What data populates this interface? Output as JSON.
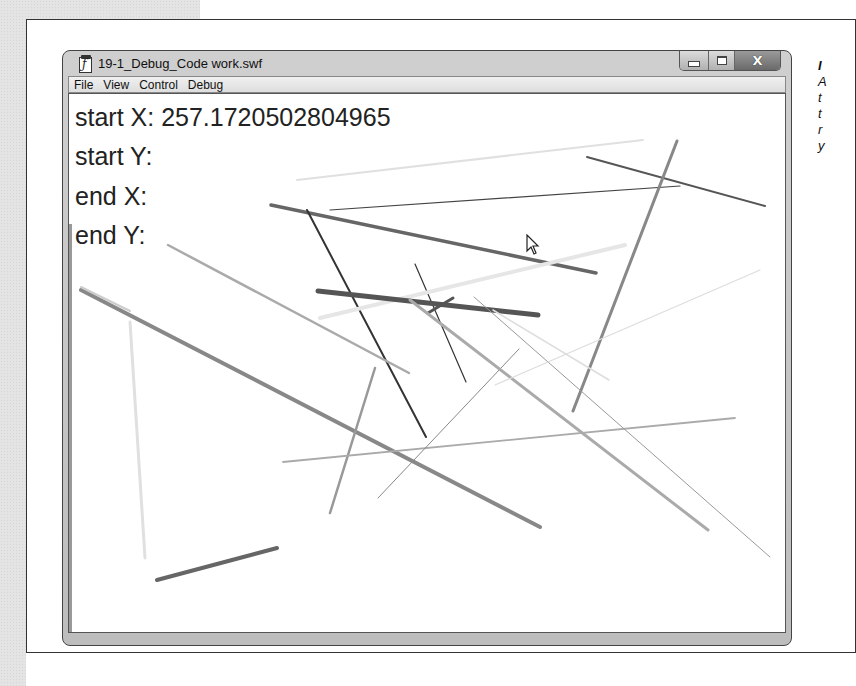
{
  "window": {
    "title": "19-1_Debug_Code work.swf",
    "icon": "flash-document-icon",
    "caption_buttons": {
      "minimize": "minimize-icon",
      "maximize": "maximize-icon",
      "close": "X"
    }
  },
  "menubar": {
    "items": [
      {
        "label": "File"
      },
      {
        "label": "View"
      },
      {
        "label": "Control"
      },
      {
        "label": "Debug"
      }
    ]
  },
  "readouts": {
    "start_x": "start X: 257.1720502804965",
    "start_y": "start Y:",
    "end_x": "end X:",
    "end_y": "end Y:"
  },
  "side_caption": {
    "lines": [
      "I",
      "A",
      "t",
      "t",
      "r",
      "y"
    ]
  },
  "canvas_lines": [
    {
      "x1": 297,
      "y1": 180,
      "x2": 643,
      "y2": 140,
      "w": 2,
      "c": "#e0e0e0"
    },
    {
      "x1": 587,
      "y1": 157,
      "x2": 765,
      "y2": 206,
      "w": 2,
      "c": "#555555"
    },
    {
      "x1": 330,
      "y1": 210,
      "x2": 680,
      "y2": 186,
      "w": 1.2,
      "c": "#444444"
    },
    {
      "x1": 271,
      "y1": 205,
      "x2": 596,
      "y2": 273,
      "w": 3.5,
      "c": "#666666"
    },
    {
      "x1": 307,
      "y1": 210,
      "x2": 426,
      "y2": 437,
      "w": 2,
      "c": "#333333"
    },
    {
      "x1": 415,
      "y1": 264,
      "x2": 466,
      "y2": 382,
      "w": 1.2,
      "c": "#333333"
    },
    {
      "x1": 320,
      "y1": 318,
      "x2": 625,
      "y2": 245,
      "w": 4,
      "c": "#e6e6e6"
    },
    {
      "x1": 318,
      "y1": 291,
      "x2": 538,
      "y2": 315,
      "w": 5,
      "c": "#555555"
    },
    {
      "x1": 428,
      "y1": 313,
      "x2": 453,
      "y2": 298,
      "w": 3,
      "c": "#555555"
    },
    {
      "x1": 677,
      "y1": 141,
      "x2": 573,
      "y2": 411,
      "w": 3,
      "c": "#888888"
    },
    {
      "x1": 168,
      "y1": 245,
      "x2": 409,
      "y2": 373,
      "w": 2.5,
      "c": "#aaaaaa"
    },
    {
      "x1": 81,
      "y1": 290,
      "x2": 540,
      "y2": 527,
      "w": 4,
      "c": "#888888"
    },
    {
      "x1": 81,
      "y1": 287,
      "x2": 130,
      "y2": 311,
      "w": 2,
      "c": "#cccccc"
    },
    {
      "x1": 130,
      "y1": 322,
      "x2": 145,
      "y2": 558,
      "w": 3,
      "c": "#e0e0e0"
    },
    {
      "x1": 157,
      "y1": 580,
      "x2": 277,
      "y2": 548,
      "w": 4,
      "c": "#666666"
    },
    {
      "x1": 375,
      "y1": 368,
      "x2": 330,
      "y2": 513,
      "w": 2.5,
      "c": "#999999"
    },
    {
      "x1": 283,
      "y1": 462,
      "x2": 735,
      "y2": 418,
      "w": 1.8,
      "c": "#aaaaaa"
    },
    {
      "x1": 378,
      "y1": 498,
      "x2": 519,
      "y2": 349,
      "w": 1,
      "c": "#888888"
    },
    {
      "x1": 410,
      "y1": 300,
      "x2": 708,
      "y2": 530,
      "w": 3,
      "c": "#aaaaaa"
    },
    {
      "x1": 474,
      "y1": 297,
      "x2": 770,
      "y2": 557,
      "w": 1,
      "c": "#999999"
    },
    {
      "x1": 493,
      "y1": 310,
      "x2": 609,
      "y2": 380,
      "w": 1.5,
      "c": "#dddddd"
    },
    {
      "x1": 495,
      "y1": 385,
      "x2": 760,
      "y2": 270,
      "w": 1.2,
      "c": "#dddddd"
    }
  ],
  "cursor": {
    "x": 526,
    "y": 234,
    "icon": "arrow-cursor-icon"
  }
}
